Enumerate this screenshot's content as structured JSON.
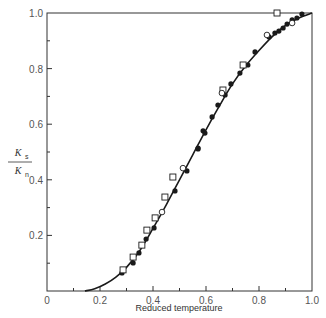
{
  "chart_data": {
    "type": "scatter",
    "title": "",
    "xlabel": "Reduced temperature",
    "ylabel": "K_s / K_n",
    "ylabel_parts": {
      "num": "K",
      "num_sub": "s",
      "den": "K",
      "den_sub": "n"
    },
    "xlim": [
      0,
      1.0
    ],
    "ylim": [
      0,
      1.0
    ],
    "x_ticks": [
      0,
      0.2,
      0.4,
      0.6,
      0.8,
      1.0
    ],
    "x_tick_labels": [
      "0",
      "0.2",
      "0.4",
      "0.6",
      "0.8",
      "1.0"
    ],
    "x_minor_ticks": [
      0.1,
      0.3,
      0.5,
      0.7,
      0.9
    ],
    "y_ticks": [
      0.2,
      0.4,
      0.6,
      0.8,
      1.0
    ],
    "y_tick_labels": [
      "0.2",
      "0.4",
      "0.6",
      "0.8",
      "1.0"
    ],
    "y_minor_ticks": [
      0.1,
      0.3,
      0.5,
      0.7,
      0.9
    ],
    "grid": false,
    "legend": null,
    "curve": {
      "name": "theory",
      "x": [
        0.143,
        0.18,
        0.22,
        0.26,
        0.3,
        0.35,
        0.4,
        0.45,
        0.5,
        0.55,
        0.6,
        0.65,
        0.7,
        0.75,
        0.8,
        0.85,
        0.9,
        0.95,
        1.0
      ],
      "y": [
        0.0,
        0.008,
        0.025,
        0.05,
        0.085,
        0.145,
        0.225,
        0.31,
        0.4,
        0.49,
        0.58,
        0.665,
        0.745,
        0.81,
        0.865,
        0.915,
        0.955,
        0.982,
        1.0
      ]
    },
    "series": [
      {
        "name": "filled circles",
        "marker": "filled-circle",
        "x": [
          0.283,
          0.325,
          0.347,
          0.374,
          0.404,
          0.483,
          0.528,
          0.57,
          0.57,
          0.589,
          0.596,
          0.623,
          0.645,
          0.672,
          0.694,
          0.728,
          0.758,
          0.785,
          0.838,
          0.86,
          0.875,
          0.891,
          0.906,
          0.925,
          0.943,
          0.962
        ],
        "y": [
          0.065,
          0.101,
          0.137,
          0.187,
          0.227,
          0.36,
          0.432,
          0.511,
          0.514,
          0.576,
          0.568,
          0.626,
          0.669,
          0.705,
          0.745,
          0.784,
          0.813,
          0.86,
          0.914,
          0.928,
          0.935,
          0.946,
          0.96,
          0.975,
          0.982,
          0.996
        ]
      },
      {
        "name": "open squares",
        "marker": "open-square",
        "x": [
          0.287,
          0.325,
          0.358,
          0.377,
          0.408,
          0.445,
          0.475,
          0.664,
          0.74,
          0.868
        ],
        "y": [
          0.076,
          0.122,
          0.165,
          0.219,
          0.263,
          0.338,
          0.41,
          0.723,
          0.813,
          1.0
        ]
      },
      {
        "name": "open circles",
        "marker": "open-circle",
        "x": [
          0.434,
          0.513,
          0.66,
          0.83,
          0.925
        ],
        "y": [
          0.284,
          0.442,
          0.712,
          0.921,
          0.964
        ]
      }
    ]
  },
  "colors": {
    "ink": "#1a1a1a",
    "axis": "#333333",
    "background": "#ffffff"
  }
}
